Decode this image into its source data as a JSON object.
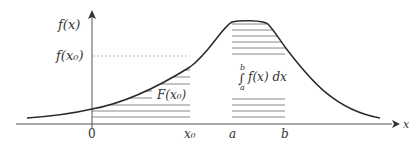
{
  "diagram": {
    "axes": {
      "y_label": "f(x)",
      "x_label": "x",
      "y_tick_label": "f(x₀)",
      "x_ticks": [
        "0",
        "x₀",
        "a",
        "b"
      ]
    },
    "annotations": {
      "cdf_label": "F(x₀)",
      "integral_upper": "b",
      "integral_sign": "∫",
      "integral_lower": "a",
      "integral_body": "f(x) dx"
    },
    "colors": {
      "curve": "#2a2a2a",
      "axis": "#555555",
      "hatch": "#7a7a7a",
      "dashed": "#aaaaaa"
    }
  }
}
